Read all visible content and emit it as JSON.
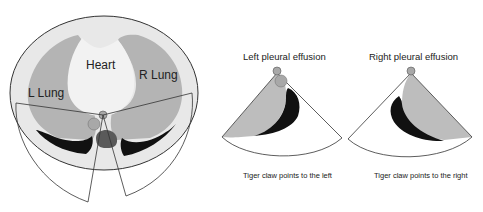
{
  "figure": {
    "cross_section": {
      "labels": {
        "heart": "Heart",
        "left_lung": "L Lung",
        "right_lung": "R Lung"
      }
    },
    "left_effusion": {
      "title": "Left pleural effusion",
      "caption": "Tiger claw points to the left"
    },
    "right_effusion": {
      "title": "Right pleural effusion",
      "caption": "Tiger claw points to the right"
    }
  },
  "colors": {
    "body": "#e6e6e6",
    "lung": "#b4b4b4",
    "heart": "#f2f2f2",
    "effusion": "#111111",
    "aorta": "#a8a8a8",
    "spine": "#5a5a5a",
    "outline": "#333333"
  }
}
